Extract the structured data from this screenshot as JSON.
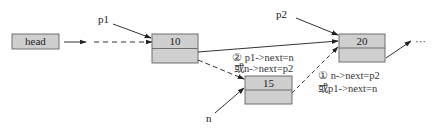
{
  "diagram": {
    "title": "",
    "colors": {
      "box_fill": "#cfcfcf",
      "box_stroke": "#6f6f6f",
      "line": "#333333"
    },
    "head": {
      "label": "head"
    },
    "nodes": [
      {
        "id": "node-10",
        "value": "10"
      },
      {
        "id": "node-15",
        "value": "15"
      },
      {
        "id": "node-20",
        "value": "20"
      }
    ],
    "pointers": {
      "p1": "p1",
      "p2": "p2",
      "n": "n"
    },
    "ellipsis": "···",
    "annotations": {
      "step2": {
        "line1": "② p1->next=n",
        "line2": "或n->next=p2"
      },
      "step1": {
        "line1": "① n->next=p2",
        "line2": "或p1->next=n"
      }
    }
  }
}
